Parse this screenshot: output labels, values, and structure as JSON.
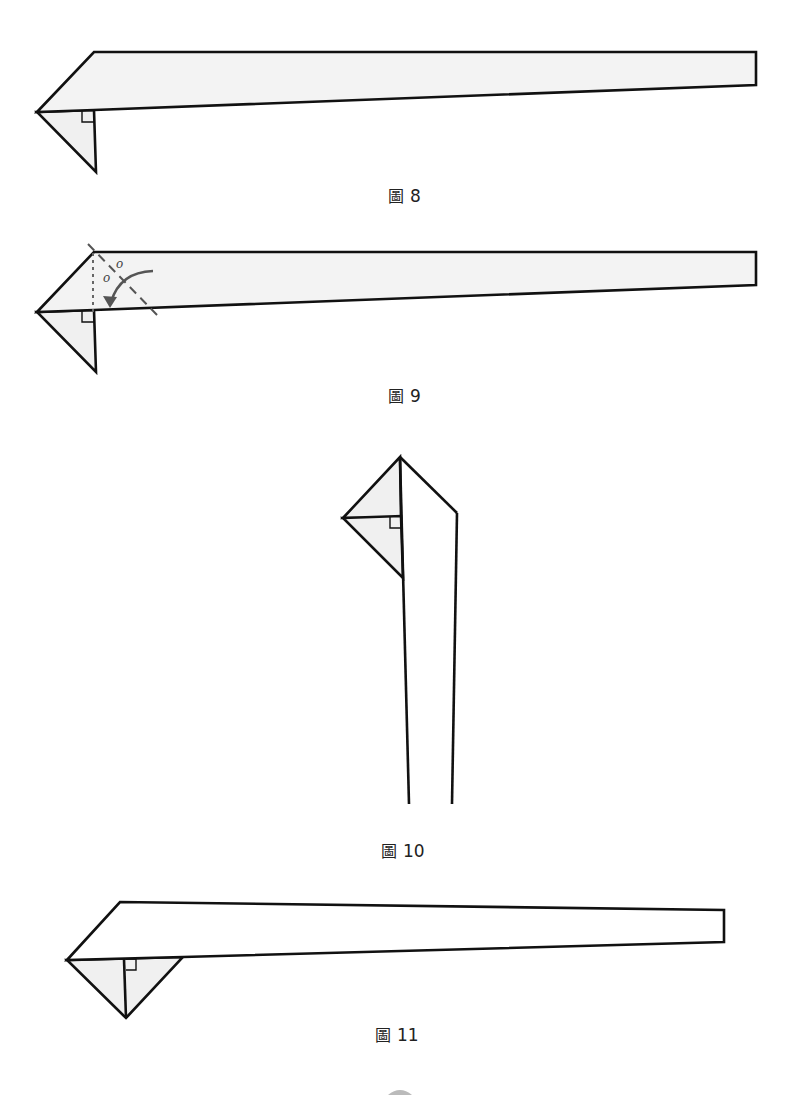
{
  "figures": [
    {
      "id": "fig8",
      "caption_prefix": "圖",
      "caption_number": "8",
      "description": "Long strip folded with a triangular flap hanging below left tip; right-angle marker"
    },
    {
      "id": "fig9",
      "caption_prefix": "圖",
      "caption_number": "9",
      "description": "Same strip with dotted vertical line, dashed fold line, two equal-angle marks labelled o, and curved fold arrow",
      "angle_labels": [
        "o",
        "o"
      ]
    },
    {
      "id": "fig10",
      "caption_prefix": "圖",
      "caption_number": "10",
      "description": "Strip rotated vertical, triangular flap on left with right-angle marker"
    },
    {
      "id": "fig11",
      "caption_prefix": "圖",
      "caption_number": "11",
      "description": "Strip horizontal with folded triangular flap below left end; right-angle marker"
    }
  ],
  "colors": {
    "stroke": "#111111",
    "fill_shaded": "#f0f0f0",
    "fill_white": "#ffffff",
    "guide": "#666666",
    "arrow": "#555555"
  }
}
